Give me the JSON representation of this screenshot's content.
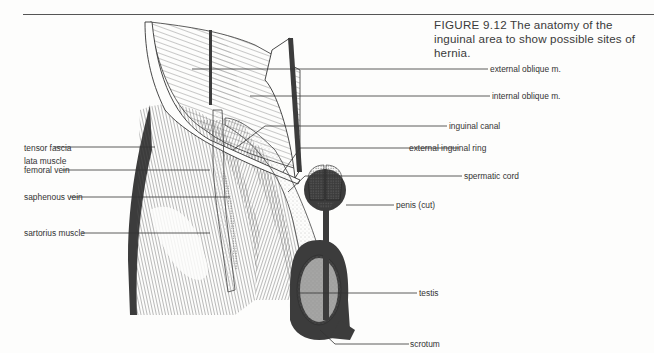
{
  "caption": {
    "figure_number": "FIGURE 9.12",
    "text": "The anatomy of the inguinal area to show possible sites of hernia."
  },
  "labels": {
    "left": [
      {
        "id": "tensor-fascia-lata",
        "text": "tensor fascia",
        "text2": "lata muscle"
      },
      {
        "id": "femoral-vein",
        "text": "femoral vein"
      },
      {
        "id": "saphenous-vein",
        "text": "saphenous vein"
      },
      {
        "id": "sartorius-muscle",
        "text": "sartorius muscle"
      }
    ],
    "right": [
      {
        "id": "external-oblique",
        "text": "external oblique m."
      },
      {
        "id": "internal-oblique",
        "text": "internal oblique m."
      },
      {
        "id": "inguinal-canal",
        "text": "inguinal canal"
      },
      {
        "id": "external-inguinal-ring",
        "text": "external inguinal  ring"
      },
      {
        "id": "spermatic-cord",
        "text": "spermatic cord"
      },
      {
        "id": "penis",
        "text": "penis (cut)"
      },
      {
        "id": "testis",
        "text": "testis"
      },
      {
        "id": "scrotum",
        "text": "scrotum"
      }
    ]
  },
  "colors": {
    "ink": "#2b2b2b",
    "dark_tissue": "#3c3c3c",
    "paper": "#fdfdfc"
  }
}
